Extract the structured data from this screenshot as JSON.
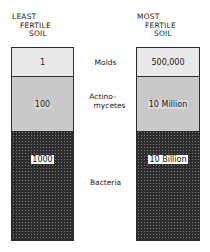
{
  "columns": [
    {
      "header": [
        "LEAST",
        "FERTILE",
        "SOIL"
      ],
      "values": {
        "molds": "1",
        "actinomycetes": "100",
        "bacteria": "1000"
      }
    },
    {
      "header": [
        "MOST",
        "FERTILE",
        "SOIL"
      ],
      "values": {
        "molds": "500,000",
        "actinomycetes": "10 Million",
        "bacteria": "10 Billion"
      }
    }
  ],
  "labels": {
    "molds": "Molds",
    "actinomycetes_line1": "Actino-",
    "actinomycetes_line2": "mycetes",
    "bacteria": "Bacteria"
  },
  "colors": {
    "molds_fill": "#e9e9e9",
    "actinomycetes_fill": "#c9c9c9",
    "bacteria_fill": "#2c2c2c"
  }
}
